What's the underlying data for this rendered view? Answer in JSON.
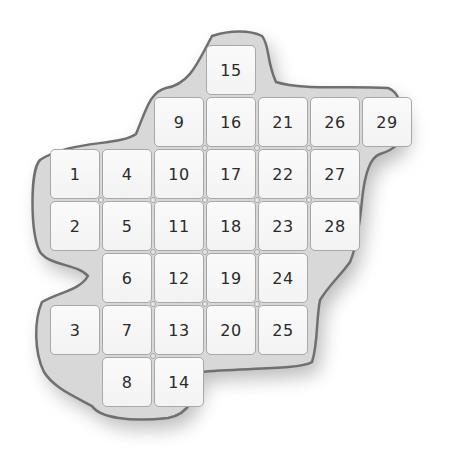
{
  "board": {
    "cell_size": 52,
    "origin": {
      "x": 50,
      "y": 45
    },
    "colors": {
      "blob_fill": "#d8d8d8",
      "blob_outline": "#6e6e6e",
      "cell_fill": "#f6f6f6",
      "cell_border": "#a8a8a8",
      "text": "#2b2b2b"
    },
    "cells": [
      {
        "label": "1",
        "col": 0,
        "row": 2
      },
      {
        "label": "2",
        "col": 0,
        "row": 3
      },
      {
        "label": "3",
        "col": 0,
        "row": 5
      },
      {
        "label": "4",
        "col": 1,
        "row": 2
      },
      {
        "label": "5",
        "col": 1,
        "row": 3
      },
      {
        "label": "6",
        "col": 1,
        "row": 4
      },
      {
        "label": "7",
        "col": 1,
        "row": 5
      },
      {
        "label": "8",
        "col": 1,
        "row": 6
      },
      {
        "label": "9",
        "col": 2,
        "row": 1
      },
      {
        "label": "10",
        "col": 2,
        "row": 2
      },
      {
        "label": "11",
        "col": 2,
        "row": 3
      },
      {
        "label": "12",
        "col": 2,
        "row": 4
      },
      {
        "label": "13",
        "col": 2,
        "row": 5
      },
      {
        "label": "14",
        "col": 2,
        "row": 6
      },
      {
        "label": "15",
        "col": 3,
        "row": 0
      },
      {
        "label": "16",
        "col": 3,
        "row": 1
      },
      {
        "label": "17",
        "col": 3,
        "row": 2
      },
      {
        "label": "18",
        "col": 3,
        "row": 3
      },
      {
        "label": "19",
        "col": 3,
        "row": 4
      },
      {
        "label": "20",
        "col": 3,
        "row": 5
      },
      {
        "label": "21",
        "col": 4,
        "row": 1
      },
      {
        "label": "22",
        "col": 4,
        "row": 2
      },
      {
        "label": "23",
        "col": 4,
        "row": 3
      },
      {
        "label": "24",
        "col": 4,
        "row": 4
      },
      {
        "label": "25",
        "col": 4,
        "row": 5
      },
      {
        "label": "26",
        "col": 5,
        "row": 1
      },
      {
        "label": "27",
        "col": 5,
        "row": 2
      },
      {
        "label": "28",
        "col": 5,
        "row": 3
      },
      {
        "label": "29",
        "col": 6,
        "row": 1
      }
    ]
  }
}
